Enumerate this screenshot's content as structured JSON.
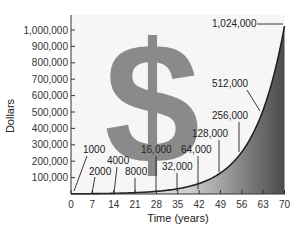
{
  "chart_data": {
    "type": "area",
    "title": "",
    "xlabel": "Time (years)",
    "ylabel": "Dollars",
    "xlim": [
      0,
      70
    ],
    "ylim": [
      0,
      1050000
    ],
    "grid": false,
    "legend": null,
    "x_ticks": [
      0,
      7,
      14,
      21,
      28,
      35,
      42,
      49,
      56,
      63,
      70
    ],
    "y_ticks": [
      100000,
      200000,
      300000,
      400000,
      500000,
      600000,
      700000,
      800000,
      900000,
      1000000
    ],
    "y_tick_labels": [
      "100,000",
      "200,000",
      "300,000",
      "400,000",
      "500,000",
      "600,000",
      "700,000",
      "800,000",
      "900,000",
      "1,000,000"
    ],
    "series": [
      {
        "name": "Doubling every 7 years",
        "x": [
          0,
          7,
          14,
          21,
          28,
          35,
          42,
          49,
          56,
          63,
          70
        ],
        "values": [
          1000,
          2000,
          4000,
          8000,
          16000,
          32000,
          64000,
          128000,
          256000,
          512000,
          1024000
        ]
      }
    ],
    "annotations": [
      {
        "text": "1000",
        "x": 0,
        "value": 1000
      },
      {
        "text": "2000",
        "x": 7,
        "value": 2000
      },
      {
        "text": "4000",
        "x": 14,
        "value": 4000
      },
      {
        "text": "8000",
        "x": 21,
        "value": 8000
      },
      {
        "text": "16,000",
        "x": 28,
        "value": 16000
      },
      {
        "text": "32,000",
        "x": 35,
        "value": 32000
      },
      {
        "text": "64,000",
        "x": 42,
        "value": 64000
      },
      {
        "text": "128,000",
        "x": 49,
        "value": 128000
      },
      {
        "text": "256,000",
        "x": 56,
        "value": 256000
      },
      {
        "text": "512,000",
        "x": 63,
        "value": 512000
      },
      {
        "text": "1,024,000",
        "x": 70,
        "value": 1024000
      }
    ],
    "background_symbol": "$",
    "colors": {
      "curve": "#222222",
      "area_fill_light": "#f0f0f0",
      "area_fill_dark": "#555555",
      "dollar_sign": "#8a8a8a",
      "plot_background": "#f6f6f6"
    }
  }
}
